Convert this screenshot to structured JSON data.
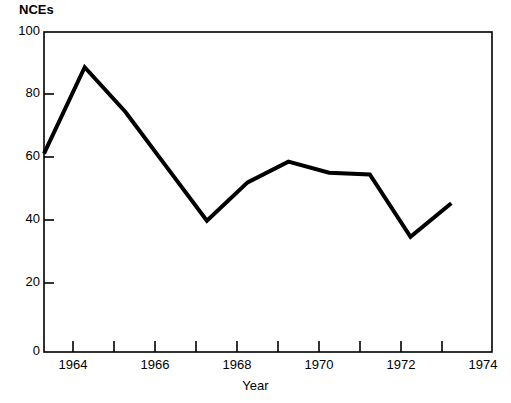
{
  "chart_data": {
    "type": "line",
    "title": "",
    "xlabel": "Year",
    "ylabel": "NCEs",
    "xlim": [
      1963,
      1974
    ],
    "ylim": [
      0,
      100
    ],
    "grid": false,
    "legend": null,
    "x": [
      1963,
      1964,
      1965,
      1966,
      1967,
      1968,
      1969,
      1970,
      1971,
      1972,
      1973
    ],
    "values": [
      62,
      89,
      75,
      58,
      41,
      53,
      59.5,
      56,
      55.5,
      36,
      46.5
    ],
    "series": [
      {
        "name": "NCEs",
        "values": [
          62,
          89,
          75,
          58,
          41,
          53,
          59.5,
          56,
          55.5,
          36,
          46.5
        ]
      }
    ],
    "y_ticks": [
      0,
      20,
      40,
      60,
      80,
      100
    ],
    "y_tick_labels": [
      "0",
      "20",
      "40",
      "60",
      "80",
      "100"
    ],
    "x_ticks": [
      1963,
      1964,
      1965,
      1966,
      1967,
      1968,
      1969,
      1970,
      1971,
      1972,
      1973,
      1974
    ],
    "x_tick_labels": [
      "",
      "1964",
      "",
      "1966",
      "",
      "1968",
      "",
      "1970",
      "",
      "1972",
      "",
      "1974"
    ],
    "x_labeled_ticks": [
      {
        "value": 1964,
        "label": "1964"
      },
      {
        "value": 1966,
        "label": "1966"
      },
      {
        "value": 1968,
        "label": "1968"
      },
      {
        "value": 1970,
        "label": "1970"
      },
      {
        "value": 1972,
        "label": "1972"
      },
      {
        "value": 1974,
        "label": "1974"
      }
    ],
    "line_color": "#000000",
    "line_width": 4,
    "axis_color": "#000000",
    "background_color": "#ffffff"
  }
}
